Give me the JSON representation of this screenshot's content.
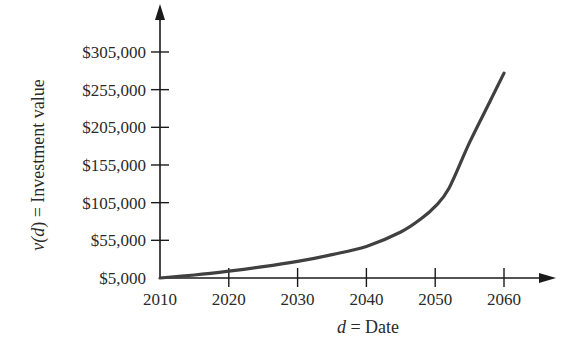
{
  "chart_data": {
    "type": "line",
    "title": "",
    "xlabel": "d = Date",
    "xlabel_var": "d",
    "xlabel_rest": " = Date",
    "ylabel": "v(d) = Investment value",
    "ylabel_var_open": "v(",
    "ylabel_var_d": "d",
    "ylabel_var_close": ")",
    "ylabel_rest": " = Investment value",
    "x_ticks": [
      2010,
      2020,
      2030,
      2040,
      2050,
      2060
    ],
    "x_tick_labels": [
      "2010",
      "2020",
      "2030",
      "2040",
      "2050",
      "2060"
    ],
    "y_ticks": [
      5000,
      55000,
      105000,
      155000,
      205000,
      255000,
      305000
    ],
    "y_tick_labels": [
      "$5,000",
      "$55,000",
      "$105,000",
      "$155,000",
      "$205,000",
      "$255,000",
      "$305,000"
    ],
    "xlim": [
      2010,
      2070
    ],
    "ylim": [
      5000,
      330000
    ],
    "grid": false,
    "legend": null,
    "series": [
      {
        "name": "v(d)",
        "x": [
          2010,
          2015,
          2020,
          2025,
          2030,
          2035,
          2040,
          2045,
          2048,
          2050,
          2052,
          2055,
          2058,
          2060
        ],
        "values": [
          5000,
          9000,
          14000,
          20000,
          27000,
          36000,
          47000,
          66000,
          84000,
          100000,
          124000,
          185000,
          240000,
          277000
        ],
        "color": "#404040"
      }
    ]
  },
  "colors": {
    "axis": "#1a1a1a",
    "curve": "#404040",
    "text": "#2a2a2a",
    "background": "#ffffff"
  }
}
